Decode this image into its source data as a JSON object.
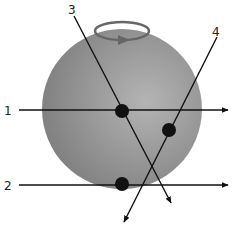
{
  "diagram": {
    "sphere": {
      "cx": 122,
      "cy": 109,
      "r": 80,
      "color_light": "#b4b4b4",
      "color_dark": "#7d7d7d"
    },
    "rotation_indicator": {
      "cx": 122,
      "cy": 31,
      "rx": 27,
      "ry": 9,
      "color": "#666666"
    },
    "lines": [
      {
        "label": "1",
        "x1": 19,
        "y1": 110,
        "x2": 228,
        "y2": 110,
        "label_x": 4,
        "label_y": 115
      },
      {
        "label": "2",
        "x1": 19,
        "y1": 185,
        "x2": 228,
        "y2": 185,
        "label_x": 4,
        "label_y": 190
      },
      {
        "label": "3",
        "x1": 74,
        "y1": 16,
        "x2": 171,
        "y2": 203,
        "label_x": 68,
        "label_y": 14
      },
      {
        "label": "4",
        "x1": 217,
        "y1": 37,
        "x2": 124,
        "y2": 222,
        "label_x": 212,
        "label_y": 36
      }
    ],
    "points": [
      {
        "cx": 122,
        "cy": 111,
        "r": 7
      },
      {
        "cx": 169,
        "cy": 130,
        "r": 7
      },
      {
        "cx": 122,
        "cy": 184,
        "r": 7
      }
    ]
  }
}
